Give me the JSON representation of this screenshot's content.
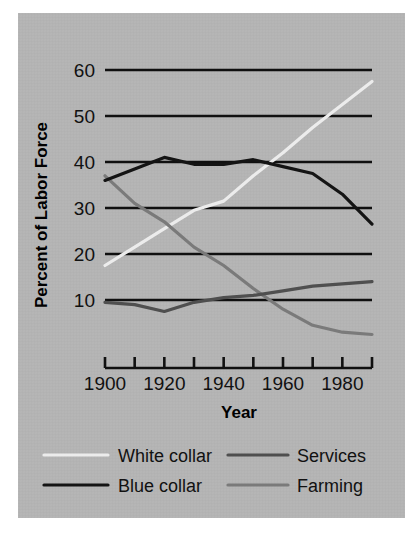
{
  "figure": {
    "panel_background": "#b5b5b5",
    "page_background": "#ffffff"
  },
  "chart_data": {
    "type": "line",
    "title": "",
    "xlabel": "Year",
    "ylabel": "Percent of Labor Force",
    "xlim": [
      1900,
      1990
    ],
    "ylim": [
      0,
      62
    ],
    "grid": true,
    "grid_axis": "y",
    "legend_position": "bottom",
    "x_tick_values": [
      1900,
      1910,
      1920,
      1930,
      1940,
      1950,
      1960,
      1970,
      1980,
      1990
    ],
    "x_tick_labels": [
      "1900",
      "",
      "1920",
      "",
      "1940",
      "",
      "1960",
      "",
      "1980",
      ""
    ],
    "x_labeled_ticks": [
      "1900",
      "1920",
      "1940",
      "1960",
      "1980"
    ],
    "y_tick_values": [
      10,
      20,
      30,
      40,
      50,
      60
    ],
    "y_tick_labels": [
      "10",
      "20",
      "30",
      "40",
      "50",
      "60"
    ],
    "x": [
      1900,
      1910,
      1920,
      1930,
      1940,
      1950,
      1960,
      1970,
      1980,
      1990
    ],
    "series": [
      {
        "name": "White collar",
        "color": "#ececec",
        "values": [
          17.5,
          21.5,
          25.5,
          29.5,
          31.5,
          37.0,
          42.0,
          47.5,
          52.5,
          57.5
        ]
      },
      {
        "name": "Blue collar",
        "color": "#141414",
        "values": [
          36.0,
          38.5,
          41.0,
          39.5,
          39.5,
          40.5,
          39.0,
          37.5,
          33.0,
          26.5
        ]
      },
      {
        "name": "Services",
        "color": "#4f4f4f",
        "values": [
          9.5,
          9.0,
          7.5,
          9.5,
          10.5,
          11.0,
          12.0,
          13.0,
          13.5,
          14.0
        ]
      },
      {
        "name": "Farming",
        "color": "#7a7a7a",
        "values": [
          37.0,
          31.0,
          27.0,
          21.5,
          17.5,
          12.5,
          8.0,
          4.5,
          3.0,
          2.5
        ]
      }
    ]
  },
  "legend": {
    "entries": [
      {
        "label": "White collar",
        "color": "#ececec"
      },
      {
        "label": "Services",
        "color": "#4f4f4f"
      },
      {
        "label": "Blue collar",
        "color": "#141414"
      },
      {
        "label": "Farming",
        "color": "#7a7a7a"
      }
    ]
  }
}
